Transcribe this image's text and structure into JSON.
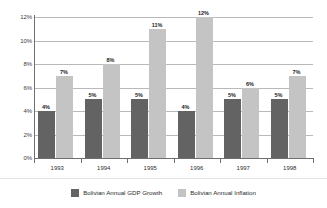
{
  "chart_data": {
    "type": "bar",
    "title": "",
    "xlabel": "",
    "ylabel": "",
    "ylim": [
      0,
      12
    ],
    "grid": true,
    "legend_position": "bottom",
    "categories": [
      "1993",
      "1994",
      "1995",
      "1996",
      "1997",
      "1998"
    ],
    "y_ticks": [
      "0%",
      "2%",
      "4%",
      "6%",
      "8%",
      "10%",
      "12%"
    ],
    "y_tick_values": [
      0,
      2,
      4,
      6,
      8,
      10,
      12
    ],
    "series": [
      {
        "name": "Bolivian Annual GDP Growth",
        "color": "#636363",
        "values": [
          4,
          5,
          5,
          4,
          5,
          5
        ],
        "labels": [
          "4%",
          "5%",
          "5%",
          "4%",
          "5%",
          "5%"
        ]
      },
      {
        "name": "Bolivian Annual Inflation",
        "color": "#c4c4c4",
        "values": [
          7,
          8,
          11,
          12,
          6,
          7
        ],
        "labels": [
          "7%",
          "8%",
          "11%",
          "12%",
          "6%",
          "7%"
        ]
      }
    ]
  },
  "legend": {
    "items": [
      {
        "label": "Bolivian Annual GDP Growth",
        "color": "#636363"
      },
      {
        "label": "Bolivian Annual Inflation",
        "color": "#c4c4c4"
      }
    ]
  },
  "colors": {
    "background": "#ffffff",
    "gridline": "#b9b9b9",
    "axis": "#6f6f6f",
    "text": "#2b2b2b",
    "series_gdp": "#636363",
    "series_inflation": "#c4c4c4"
  }
}
